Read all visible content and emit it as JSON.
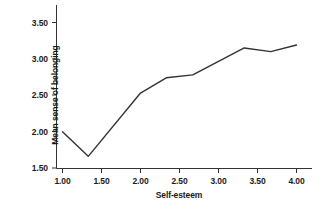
{
  "chart_data": {
    "type": "line",
    "title": "",
    "xlabel": "Self-esteem",
    "ylabel": "Mean sense of belonging",
    "xlim": [
      1.0,
      4.0
    ],
    "ylim": [
      1.5,
      3.5
    ],
    "xticks": [
      "1.00",
      "1.50",
      "2.00",
      "2.50",
      "3.00",
      "3.50",
      "4.00"
    ],
    "xtick_values": [
      1.0,
      1.5,
      2.0,
      2.5,
      3.0,
      3.5,
      4.0
    ],
    "yticks": [
      "1.50",
      "2.00",
      "2.50",
      "3.00",
      "3.50"
    ],
    "ytick_values": [
      1.5,
      2.0,
      2.5,
      3.0,
      3.5
    ],
    "grid": false,
    "legend": "none",
    "series": [
      {
        "name": "Mean sense of belonging",
        "color": "#333333",
        "x": [
          1.0,
          1.33,
          2.0,
          2.33,
          2.67,
          3.33,
          3.67,
          4.0
        ],
        "y": [
          2.0,
          1.66,
          2.53,
          2.74,
          2.78,
          3.15,
          3.1,
          3.19
        ]
      }
    ]
  }
}
